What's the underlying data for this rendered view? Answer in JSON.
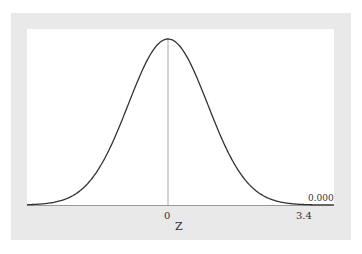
{
  "chart_data": {
    "type": "line",
    "title": "",
    "xlabel": "Z",
    "ylabel": "",
    "x_ticks": [
      "0",
      "3.4"
    ],
    "x_range": [
      -3.55,
      4.18
    ],
    "ylim": [
      0,
      0.3989
    ],
    "grid": false,
    "annotations": [
      {
        "text": "0.000",
        "x": 3.4,
        "note": "tail area to the right of 3.4"
      }
    ],
    "series": [
      {
        "name": "N(0,1) density",
        "mean": 0,
        "sd": 1
      }
    ],
    "center_line_x": 0
  },
  "labels": {
    "tick_zero": "0",
    "tick_value": "3.4",
    "axis_label": "Z",
    "area_value": "0.000"
  }
}
